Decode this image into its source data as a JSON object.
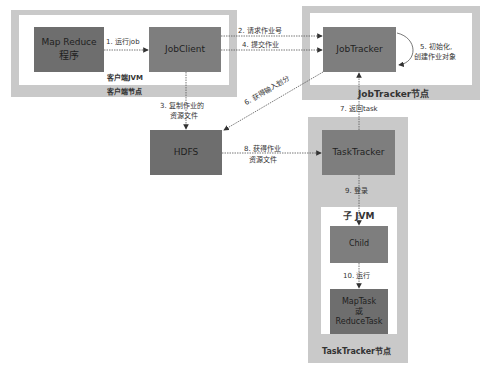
{
  "diagram": {
    "type": "flowchart",
    "colors": {
      "frame": "#c9c9c9",
      "box_dark": "#6e6e6e",
      "box_mid": "#7e7e7e",
      "arrow": "#555555"
    },
    "containers": {
      "client_node": "客户端节点",
      "client_jvm": "客户端JVM",
      "jobtracker_node": "JobTracker节点",
      "tasktracker_node": "TaskTracker节点",
      "child_jvm": "子 JVM"
    },
    "nodes": {
      "mapreduce": {
        "line1": "Map Reduce",
        "line2": "程序"
      },
      "jobclient": "JobClient",
      "jobtracker": "JobTracker",
      "hdfs": "HDFS",
      "tasktracker": "TaskTracker",
      "child": "Child",
      "task": {
        "line1": "MapTask",
        "line2": "或",
        "line3": "ReduceTask"
      }
    },
    "edges": {
      "e1": "1. 运行job",
      "e2": "2. 请求作业号",
      "e3a": "3. 复制作业的",
      "e3b": "资源文件",
      "e4": "4. 提交作业",
      "e5a": "5. 初始化,",
      "e5b": "创建作业对象",
      "e6": "6. 获得输入划分",
      "e7": "7. 返回task",
      "e8a": "8. 获得作业",
      "e8b": "资源文件",
      "e9": "9. 登录",
      "e10": "10. 运行"
    }
  }
}
